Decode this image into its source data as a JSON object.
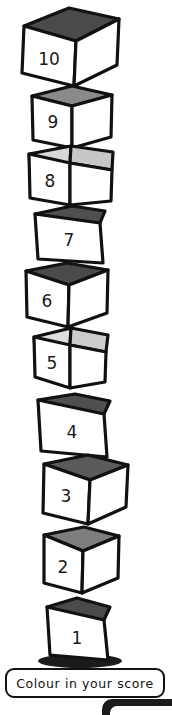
{
  "worksheet": {
    "title": "Score tower",
    "caption": {
      "text": "Colour in your score"
    },
    "colors": {
      "outline": "#111111",
      "face_front": "#ffffff",
      "face_side": "#ffffff",
      "top_dark": "#4a4a4a",
      "top_mid": "#7d7d7d",
      "top_light": "#d8d8d8",
      "shadow": "#1b1b1b",
      "number": "#1a1a1a"
    },
    "tower": {
      "total_blocks": 10,
      "order": "bottom-to-top",
      "blocks": [
        {
          "value": "1",
          "label": "block-1"
        },
        {
          "value": "2",
          "label": "block-2"
        },
        {
          "value": "3",
          "label": "block-3"
        },
        {
          "value": "4",
          "label": "block-4"
        },
        {
          "value": "5",
          "label": "block-5"
        },
        {
          "value": "6",
          "label": "block-6"
        },
        {
          "value": "7",
          "label": "block-7"
        },
        {
          "value": "8",
          "label": "block-8"
        },
        {
          "value": "9",
          "label": "block-9"
        },
        {
          "value": "10",
          "label": "block-10"
        }
      ]
    }
  }
}
